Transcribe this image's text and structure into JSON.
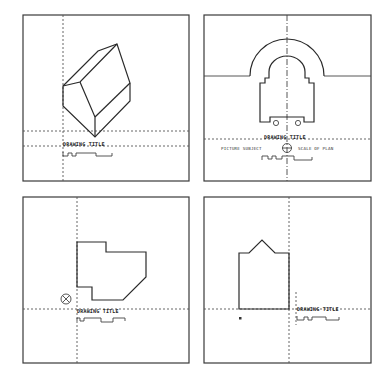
{
  "sheet": {
    "panels": [
      {
        "id": "isometric-view",
        "title": "DRAWING TITLE",
        "drawing": "isometric house with gable roof"
      },
      {
        "id": "elevation-view",
        "title": "DRAWING TITLE",
        "drawing": "arched facade elevation",
        "caption_left": "PICTURE SUBJECT",
        "caption_right": "SCALE OF PLAN",
        "symbol": "north-arrow-circle"
      },
      {
        "id": "plan-view",
        "title": "DRAWING TITLE",
        "drawing": "floor plan outline",
        "symbol": "north-arrow-circle-x"
      },
      {
        "id": "section-view",
        "title": "DRAWING TITLE",
        "drawing": "gabled facade outline",
        "marker": "a"
      }
    ]
  },
  "colors": {
    "ink": "#2a2a2a",
    "paper": "#ffffff",
    "guide": "#555555"
  }
}
